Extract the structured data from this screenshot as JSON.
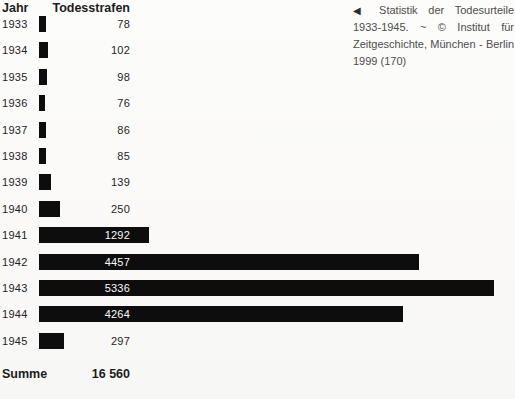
{
  "chart_data": {
    "type": "bar",
    "orientation": "horizontal",
    "col_year_header": "Jahr",
    "col_value_header": "Todesstrafen",
    "categories": [
      "1933",
      "1934",
      "1935",
      "1936",
      "1937",
      "1938",
      "1939",
      "1940",
      "1941",
      "1942",
      "1943",
      "1944",
      "1945"
    ],
    "values": [
      78,
      102,
      98,
      76,
      86,
      85,
      139,
      250,
      1292,
      4457,
      5336,
      4264,
      297
    ],
    "value_labels": [
      "78",
      "102",
      "98",
      "76",
      "86",
      "85",
      "139",
      "250",
      "1292",
      "4457",
      "5336",
      "4264",
      "297"
    ],
    "summary_label": "Summe",
    "summary_value": "16 560",
    "bar_color": "#0d0d0d",
    "grid": false,
    "legend": false,
    "xlim": [
      0,
      5336
    ]
  },
  "caption": {
    "marker": "◀",
    "lines": [
      "◀ Statistik der Todesurteile",
      "1933-1945. ~ © Institut für",
      "Zeitgeschichte, München - Berlin",
      "1999 (170)"
    ],
    "text": "◀ Statistik der Todesurteile 1933-1945. ~ © Institut für Zeitgeschichte, München - Berlin 1999 (170)"
  }
}
